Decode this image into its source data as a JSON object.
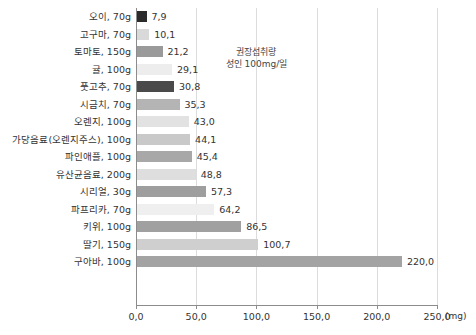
{
  "chart_data": {
    "type": "bar",
    "orientation": "horizontal",
    "title": "",
    "xlabel": "(mg)",
    "ylabel": "",
    "xlim": [
      0,
      250
    ],
    "xticks": [
      "0,0",
      "50,0",
      "100,0",
      "150,0",
      "200,0",
      "250,0"
    ],
    "xtick_values": [
      0,
      50,
      100,
      150,
      200,
      250
    ],
    "grid": true,
    "legend": "none",
    "unit_label": "(mg)",
    "categories": [
      "오이, 70g",
      "고구마, 70g",
      "토마토, 150g",
      "귤, 100g",
      "풋고추, 70g",
      "시금치, 70g",
      "오렌지, 100g",
      "가당음료(오렌지주스), 100g",
      "파인애플, 100g",
      "유산균음료, 200g",
      "시리얼, 30g",
      "파프리카, 70g",
      "키위, 100g",
      "딸기, 150g",
      "구아바, 100g"
    ],
    "values": [
      7.9,
      10.1,
      21.2,
      29.1,
      30.8,
      35.3,
      43.0,
      44.1,
      45.4,
      48.8,
      57.3,
      64.2,
      86.5,
      100.7,
      220.0
    ],
    "value_labels": [
      "7,9",
      "10,1",
      "21,2",
      "29,1",
      "30,8",
      "35,3",
      "43,0",
      "44,1",
      "45,4",
      "48,8",
      "57,3",
      "64,2",
      "86,5",
      "100,7",
      "220,0"
    ],
    "bar_colors": [
      "#2b2b2b",
      "#d9d9d9",
      "#9a9a9a",
      "#ededed",
      "#4a4a4a",
      "#b4b4b4",
      "#e2e2e2",
      "#c9c9c9",
      "#a8a8a8",
      "#dedede",
      "#9e9e9e",
      "#efefef",
      "#a0a0a0",
      "#cfcfcf",
      "#a3a3a3"
    ],
    "annotation": {
      "line1": "권장섭취량",
      "line2": "성인 100mg/일",
      "at_value": 100
    }
  }
}
